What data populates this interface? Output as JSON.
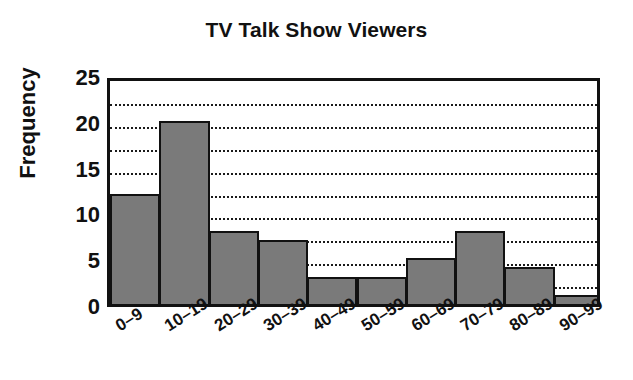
{
  "chart_data": {
    "type": "bar",
    "title": "TV Talk Show Viewers",
    "xlabel": "",
    "ylabel": "Frequency",
    "categories": [
      "0–9",
      "10–19",
      "20–29",
      "30–39",
      "40–49",
      "50–59",
      "60–69",
      "70–79",
      "80–89",
      "90–99"
    ],
    "values": [
      12,
      20,
      8,
      7,
      3,
      3,
      5,
      8,
      4,
      1
    ],
    "ylim": [
      0,
      25
    ],
    "y_tick_labels": [
      "25",
      "20",
      "15",
      "10",
      "5",
      "0"
    ],
    "y_tick_values": [
      25,
      20,
      15,
      10,
      5,
      0
    ],
    "gridlines": [
      22.5,
      20,
      17.5,
      15,
      12.5,
      10,
      7.5,
      5,
      2.5
    ],
    "grid": true,
    "legend": "none",
    "bar_color": "#7a7a7a",
    "bar_edge_color": "#111111",
    "axis_color": "#111111",
    "gridline_color": "#1a1a1a",
    "background_color": "#ffffff",
    "bar_gap": 0,
    "style": "histogram"
  }
}
